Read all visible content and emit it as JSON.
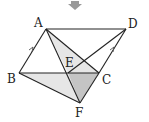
{
  "diagram": {
    "type": "geometry",
    "points": {
      "A": {
        "label": "A",
        "x": 46,
        "y": 29
      },
      "D": {
        "label": "D",
        "x": 126,
        "y": 29
      },
      "B": {
        "label": "B",
        "x": 19,
        "y": 73
      },
      "C": {
        "label": "C",
        "x": 99,
        "y": 73
      },
      "E": {
        "label": "E",
        "x": 68,
        "y": 73
      },
      "F": {
        "label": "F",
        "x": 80,
        "y": 103
      }
    },
    "labels": [
      "A",
      "D",
      "B",
      "C",
      "E",
      "F"
    ],
    "colors": {
      "stroke": "#222222",
      "light_fill": "#e6e6e6",
      "dark_fill": "#c4c4c4"
    }
  }
}
